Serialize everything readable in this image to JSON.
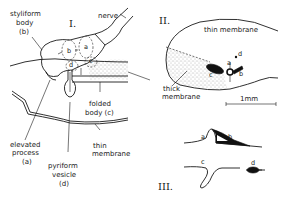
{
  "panels": {
    "panel1": {
      "numeral": "I.",
      "labels": {
        "nerve": "nerve",
        "styliform_1": "styliform",
        "styliform_2": "body",
        "styliform_3": "(b)",
        "a": "a",
        "b": "b",
        "c": "c",
        "d": "d",
        "folded_1": "folded",
        "folded_2": "body (c)",
        "elevated_1": "elevated",
        "elevated_2": "process",
        "elevated_3": "(a)",
        "pyriform_1": "pyriform",
        "pyriform_2": "vesicle",
        "pyriform_3": "(d)",
        "thin_1": "thin",
        "thin_2": "membrane"
      }
    },
    "panel2": {
      "numeral": "II.",
      "labels": {
        "thin_membrane": "thin membrane",
        "thick_1": "thick",
        "thick_2": "membrane",
        "a": "a",
        "b": "b",
        "c": "c",
        "d": "d",
        "scale": "1mm"
      }
    },
    "panel3": {
      "numeral": "III.",
      "labels": {
        "a": "a",
        "b": "b",
        "c": "c",
        "d": "d"
      }
    }
  }
}
